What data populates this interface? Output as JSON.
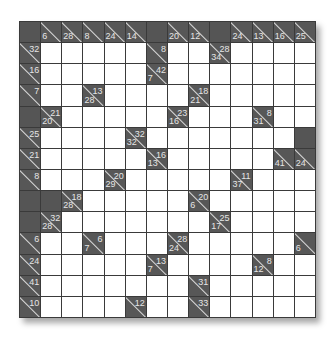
{
  "puzzle": {
    "type": "kakuro",
    "size": 14,
    "colors": {
      "block": "#555555",
      "clue": "#575757",
      "white": "#ffffff",
      "grid": "#3a3a3a",
      "text": "#e6e6e6"
    },
    "rows": [
      [
        {
          "t": "b"
        },
        {
          "t": "c",
          "d": "6"
        },
        {
          "t": "c",
          "d": "28"
        },
        {
          "t": "c",
          "d": "8"
        },
        {
          "t": "c",
          "d": "24"
        },
        {
          "t": "c",
          "d": "14"
        },
        {
          "t": "b"
        },
        {
          "t": "c",
          "d": "20"
        },
        {
          "t": "c",
          "d": "12"
        },
        {
          "t": "b"
        },
        {
          "t": "c",
          "d": "24"
        },
        {
          "t": "c",
          "d": "13"
        },
        {
          "t": "c",
          "d": "16"
        },
        {
          "t": "c",
          "d": "25"
        }
      ],
      [
        {
          "t": "c",
          "a": "32"
        },
        {
          "t": "w"
        },
        {
          "t": "w"
        },
        {
          "t": "w"
        },
        {
          "t": "w"
        },
        {
          "t": "w"
        },
        {
          "t": "c",
          "a": "8"
        },
        {
          "t": "w"
        },
        {
          "t": "w"
        },
        {
          "t": "c",
          "a": "28",
          "d": "34"
        },
        {
          "t": "w"
        },
        {
          "t": "w"
        },
        {
          "t": "w"
        },
        {
          "t": "w"
        }
      ],
      [
        {
          "t": "c",
          "a": "16"
        },
        {
          "t": "w"
        },
        {
          "t": "w"
        },
        {
          "t": "w"
        },
        {
          "t": "w"
        },
        {
          "t": "w"
        },
        {
          "t": "c",
          "a": "42",
          "d": "7"
        },
        {
          "t": "w"
        },
        {
          "t": "w"
        },
        {
          "t": "w"
        },
        {
          "t": "w"
        },
        {
          "t": "w"
        },
        {
          "t": "w"
        },
        {
          "t": "w"
        }
      ],
      [
        {
          "t": "c",
          "a": "7"
        },
        {
          "t": "w"
        },
        {
          "t": "w"
        },
        {
          "t": "c",
          "a": "13",
          "d": "28"
        },
        {
          "t": "w"
        },
        {
          "t": "w"
        },
        {
          "t": "w"
        },
        {
          "t": "w"
        },
        {
          "t": "c",
          "a": "18",
          "d": "21"
        },
        {
          "t": "w"
        },
        {
          "t": "w"
        },
        {
          "t": "w"
        },
        {
          "t": "w"
        },
        {
          "t": "w"
        }
      ],
      [
        {
          "t": "b"
        },
        {
          "t": "c",
          "a": "21",
          "d": "20"
        },
        {
          "t": "w"
        },
        {
          "t": "w"
        },
        {
          "t": "w"
        },
        {
          "t": "w"
        },
        {
          "t": "w"
        },
        {
          "t": "c",
          "a": "23",
          "d": "16"
        },
        {
          "t": "w"
        },
        {
          "t": "w"
        },
        {
          "t": "w"
        },
        {
          "t": "c",
          "a": "8",
          "d": "31"
        },
        {
          "t": "w"
        },
        {
          "t": "w"
        }
      ],
      [
        {
          "t": "c",
          "a": "25"
        },
        {
          "t": "w"
        },
        {
          "t": "w"
        },
        {
          "t": "w"
        },
        {
          "t": "w"
        },
        {
          "t": "c",
          "a": "32",
          "d": "32"
        },
        {
          "t": "w"
        },
        {
          "t": "w"
        },
        {
          "t": "w"
        },
        {
          "t": "w"
        },
        {
          "t": "w"
        },
        {
          "t": "w"
        },
        {
          "t": "w"
        },
        {
          "t": "b"
        }
      ],
      [
        {
          "t": "c",
          "a": "21"
        },
        {
          "t": "w"
        },
        {
          "t": "w"
        },
        {
          "t": "w"
        },
        {
          "t": "w"
        },
        {
          "t": "w"
        },
        {
          "t": "c",
          "a": "16",
          "d": "13"
        },
        {
          "t": "w"
        },
        {
          "t": "w"
        },
        {
          "t": "w"
        },
        {
          "t": "w"
        },
        {
          "t": "w"
        },
        {
          "t": "c",
          "d": "41"
        },
        {
          "t": "c",
          "d": "24"
        }
      ],
      [
        {
          "t": "c",
          "a": "8"
        },
        {
          "t": "w"
        },
        {
          "t": "w"
        },
        {
          "t": "w"
        },
        {
          "t": "c",
          "a": "20",
          "d": "29"
        },
        {
          "t": "w"
        },
        {
          "t": "w"
        },
        {
          "t": "w"
        },
        {
          "t": "w"
        },
        {
          "t": "w"
        },
        {
          "t": "c",
          "a": "11",
          "d": "37"
        },
        {
          "t": "w"
        },
        {
          "t": "w"
        },
        {
          "t": "w"
        }
      ],
      [
        {
          "t": "b"
        },
        {
          "t": "b"
        },
        {
          "t": "c",
          "a": "18",
          "d": "28"
        },
        {
          "t": "w"
        },
        {
          "t": "w"
        },
        {
          "t": "w"
        },
        {
          "t": "w"
        },
        {
          "t": "w"
        },
        {
          "t": "c",
          "a": "20",
          "d": "6"
        },
        {
          "t": "w"
        },
        {
          "t": "w"
        },
        {
          "t": "w"
        },
        {
          "t": "w"
        },
        {
          "t": "w"
        }
      ],
      [
        {
          "t": "b"
        },
        {
          "t": "c",
          "a": "32",
          "d": "28"
        },
        {
          "t": "w"
        },
        {
          "t": "w"
        },
        {
          "t": "w"
        },
        {
          "t": "w"
        },
        {
          "t": "w"
        },
        {
          "t": "w"
        },
        {
          "t": "w"
        },
        {
          "t": "c",
          "a": "25",
          "d": "17"
        },
        {
          "t": "w"
        },
        {
          "t": "w"
        },
        {
          "t": "w"
        },
        {
          "t": "w"
        }
      ],
      [
        {
          "t": "c",
          "a": "6"
        },
        {
          "t": "w"
        },
        {
          "t": "w"
        },
        {
          "t": "c",
          "a": "6",
          "d": "7"
        },
        {
          "t": "w"
        },
        {
          "t": "w"
        },
        {
          "t": "w"
        },
        {
          "t": "c",
          "a": "28",
          "d": "24"
        },
        {
          "t": "w"
        },
        {
          "t": "w"
        },
        {
          "t": "w"
        },
        {
          "t": "w"
        },
        {
          "t": "w"
        },
        {
          "t": "c",
          "d": "6"
        }
      ],
      [
        {
          "t": "c",
          "a": "24"
        },
        {
          "t": "w"
        },
        {
          "t": "w"
        },
        {
          "t": "w"
        },
        {
          "t": "w"
        },
        {
          "t": "w"
        },
        {
          "t": "c",
          "a": "13",
          "d": "7"
        },
        {
          "t": "w"
        },
        {
          "t": "w"
        },
        {
          "t": "w"
        },
        {
          "t": "w"
        },
        {
          "t": "c",
          "a": "8",
          "d": "12"
        },
        {
          "t": "w"
        },
        {
          "t": "w"
        }
      ],
      [
        {
          "t": "c",
          "a": "41"
        },
        {
          "t": "w"
        },
        {
          "t": "w"
        },
        {
          "t": "w"
        },
        {
          "t": "w"
        },
        {
          "t": "w"
        },
        {
          "t": "w"
        },
        {
          "t": "w"
        },
        {
          "t": "c",
          "a": "31"
        },
        {
          "t": "w"
        },
        {
          "t": "w"
        },
        {
          "t": "w"
        },
        {
          "t": "w"
        },
        {
          "t": "w"
        }
      ],
      [
        {
          "t": "c",
          "a": "10"
        },
        {
          "t": "w"
        },
        {
          "t": "w"
        },
        {
          "t": "w"
        },
        {
          "t": "w"
        },
        {
          "t": "c",
          "a": "12"
        },
        {
          "t": "w"
        },
        {
          "t": "w"
        },
        {
          "t": "c",
          "a": "33"
        },
        {
          "t": "w"
        },
        {
          "t": "w"
        },
        {
          "t": "w"
        },
        {
          "t": "w"
        },
        {
          "t": "w"
        }
      ]
    ]
  }
}
